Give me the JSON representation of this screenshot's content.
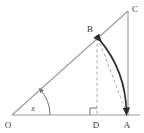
{
  "figure": {
    "background_color": "#ffffff",
    "width": 144,
    "height": 133
  },
  "labels": {
    "origin": "O",
    "foot": "D",
    "base_right": "A",
    "apex": "C",
    "arc_point": "B",
    "angle": "x"
  },
  "colors": {
    "thin_line": "#9a9a9a",
    "dashed_line": "#a8a8a8",
    "arc_line": "#2b2b2b",
    "text": "#3a3a3a",
    "right_angle": "#6f6f6f"
  },
  "geometry": {
    "points": {
      "O": {
        "x": 12,
        "y": 115,
        "label_x": 8,
        "label_y": 127
      },
      "A": {
        "x": 128,
        "y": 115,
        "label_x": 124,
        "label_y": 127
      },
      "D": {
        "x": 97,
        "y": 115,
        "label_x": 93,
        "label_y": 127
      },
      "C": {
        "x": 128,
        "y": 11,
        "label_x": 133,
        "label_y": 10
      },
      "B": {
        "x": 97,
        "y": 37,
        "label_x": 87,
        "label_y": 33
      }
    },
    "segments": [
      {
        "name": "base-OA",
        "from": "O",
        "to": "A",
        "style": "solid-thin"
      },
      {
        "name": "hypotenuse-OC",
        "from": "O",
        "to": "C",
        "style": "solid-thin"
      },
      {
        "name": "vertical-AC",
        "from": "A",
        "to": "C",
        "style": "solid-thin"
      },
      {
        "name": "segment-BD",
        "from": "B",
        "to": "D",
        "style": "dashed"
      },
      {
        "name": "segment-BA",
        "from": "B",
        "to": "A",
        "style": "dashed"
      }
    ],
    "arc": {
      "name": "arc-BA",
      "from": "B",
      "to": "A",
      "center": "O",
      "radius": 116,
      "style": "solid-thick",
      "arrowheads": "both"
    },
    "angle_arc": {
      "name": "angle-at-O",
      "vertex": "O",
      "radius": 38,
      "start_deg": 0,
      "end_deg": 42,
      "arrowhead": "end"
    },
    "right_angle_marker": {
      "name": "right-angle-at-D",
      "at": "D",
      "size": 7
    }
  }
}
